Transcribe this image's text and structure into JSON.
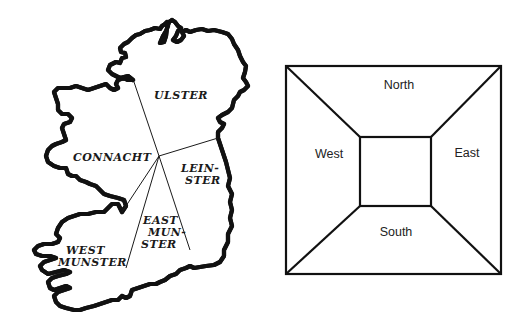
{
  "map": {
    "title": "Ireland provinces map",
    "regions": [
      {
        "id": "ulster",
        "lines": [
          "ULSTER"
        ]
      },
      {
        "id": "connacht",
        "lines": [
          "CONNACHT"
        ]
      },
      {
        "id": "leinster",
        "lines": [
          "LEIN-",
          "STER"
        ]
      },
      {
        "id": "east-munster",
        "lines": [
          "EAST",
          "MUN-",
          "STER"
        ]
      },
      {
        "id": "west-munster",
        "lines": [
          "WEST",
          "MUNSTER"
        ]
      }
    ]
  },
  "diagram": {
    "labels": {
      "north": "North",
      "west": "West",
      "east": "East",
      "south": "South"
    }
  },
  "colors": {
    "line": "#111111",
    "background": "#ffffff",
    "text": "#222222"
  }
}
